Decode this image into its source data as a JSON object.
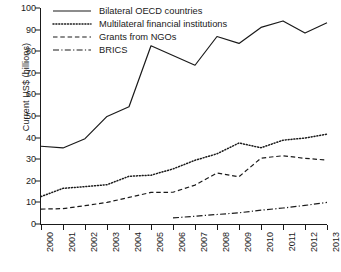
{
  "chart_data": {
    "type": "line",
    "title": "",
    "xlabel": "",
    "ylabel": "Current US$ (billions)",
    "x": [
      2000,
      2001,
      2002,
      2003,
      2004,
      2005,
      2006,
      2007,
      2008,
      2009,
      2010,
      2011,
      2012,
      2013
    ],
    "categories": [
      "2000",
      "2001",
      "2002",
      "2003",
      "2004",
      "2005",
      "2006",
      "2007",
      "2008",
      "2009",
      "2010",
      "2011",
      "2012",
      "2013"
    ],
    "xlim": [
      2000,
      2013
    ],
    "ylim": [
      0,
      100
    ],
    "yticks": [
      0,
      10,
      20,
      30,
      40,
      50,
      60,
      70,
      80,
      90,
      100
    ],
    "grid": false,
    "legend_position": "top-left",
    "series": [
      {
        "name": "Bilateral OECD countries",
        "style": "solid",
        "values": [
          36.0,
          35.2,
          39.5,
          49.8,
          54.3,
          82.5,
          78.0,
          73.5,
          86.8,
          83.6,
          91.0,
          94.0,
          88.4,
          93.2
        ]
      },
      {
        "name": "Multilateral financial institutions",
        "style": "dotted",
        "values": [
          12.7,
          16.5,
          17.3,
          18.2,
          22.1,
          22.6,
          25.5,
          29.5,
          32.5,
          37.5,
          35.3,
          38.8,
          39.8,
          41.6
        ]
      },
      {
        "name": "Grants from NGOs",
        "style": "dashed",
        "values": [
          6.9,
          7.1,
          8.5,
          10.0,
          12.3,
          14.6,
          14.7,
          18.0,
          23.6,
          21.9,
          30.5,
          31.6,
          30.4,
          29.6
        ]
      },
      {
        "name": "BRICS",
        "style": "dash-dot",
        "values": [
          null,
          null,
          null,
          null,
          null,
          null,
          2.8,
          3.6,
          4.4,
          5.2,
          6.4,
          7.4,
          8.6,
          10.0
        ]
      }
    ]
  },
  "legend": {
    "items": [
      {
        "label": "Bilateral OECD countries",
        "style": "solid"
      },
      {
        "label": "Multilateral financial institutions",
        "style": "dotted"
      },
      {
        "label": "Grants from NGOs",
        "style": "dashed"
      },
      {
        "label": "BRICS",
        "style": "dash-dot"
      }
    ]
  },
  "axes": {
    "y_title": "Current US$ (billions)",
    "y_ticks": [
      "100",
      "90",
      "80",
      "70",
      "60",
      "50",
      "40",
      "30",
      "20",
      "10",
      "0"
    ],
    "x_ticks": [
      "2000",
      "2001",
      "2002",
      "2003",
      "2004",
      "2005",
      "2006",
      "2007",
      "2008",
      "2009",
      "2010",
      "2011",
      "2012",
      "2013"
    ]
  }
}
